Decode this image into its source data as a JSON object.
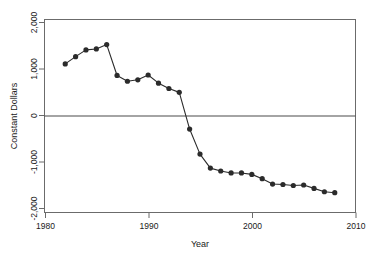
{
  "chart_data": {
    "type": "line",
    "title": "",
    "xlabel": "Year",
    "ylabel": "Constant Dollars",
    "xlim": [
      1980,
      2010
    ],
    "ylim": [
      -2000,
      2000
    ],
    "xticks": [
      1980,
      1990,
      2000,
      2010
    ],
    "xticklabels": [
      "1980",
      "1990",
      "2000",
      "2010"
    ],
    "yticks": [
      -2000,
      -1000,
      0,
      1000,
      2000
    ],
    "yticklabels": [
      "-2,000",
      "-1,000",
      "0",
      "1,000",
      "2,000"
    ],
    "grid": false,
    "legend": false,
    "reference_lines": [
      {
        "axis": "y",
        "value": 0
      }
    ],
    "marker": "filled-circle",
    "series": [
      {
        "name": "Constant Dollars",
        "color": "#2b2b2b",
        "x": [
          1982,
          1983,
          1984,
          1985,
          1986,
          1987,
          1988,
          1989,
          1990,
          1991,
          1992,
          1993,
          1994,
          1995,
          1996,
          1997,
          1998,
          1999,
          2000,
          2001,
          2002,
          2003,
          2004,
          2005,
          2006,
          2007,
          2008
        ],
        "values": [
          1080,
          1230,
          1370,
          1390,
          1480,
          840,
          720,
          750,
          850,
          680,
          570,
          490,
          -270,
          -790,
          -1080,
          -1140,
          -1180,
          -1180,
          -1210,
          -1300,
          -1410,
          -1420,
          -1440,
          -1430,
          -1500,
          -1570,
          -1590
        ]
      }
    ]
  },
  "axes": {
    "x_label": "Year",
    "y_label": "Constant Dollars"
  }
}
